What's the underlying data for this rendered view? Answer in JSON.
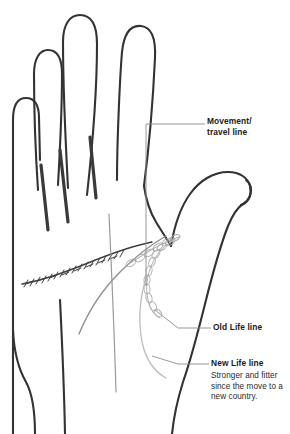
{
  "figure": {
    "type": "palmistry-diagram",
    "background_color": "#ffffff",
    "outline_color": "#333333",
    "head_line_color": "#8a8a8a",
    "life_line_color": "#b9b9b9",
    "heart_line_color": "#444444",
    "leader_color": "#8d8d8d"
  },
  "labels": {
    "movement": {
      "title": "Movement/ travel line",
      "line1": "Movement/",
      "line2": "travel line"
    },
    "old_life": {
      "title": "Old Life line"
    },
    "new_life": {
      "title": "New Life line",
      "caption": "Stronger and fitter since the move to a new country."
    }
  }
}
